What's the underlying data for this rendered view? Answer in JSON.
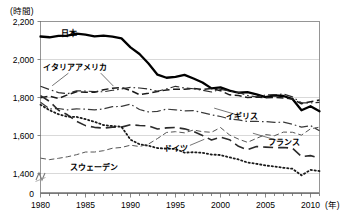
{
  "chart_data": {
    "type": "line",
    "title": "",
    "subtitle": "",
    "xlabel": "(年)",
    "ylabel": "(時間)",
    "y_unit_label": "(時間)",
    "x_unit_label": "(年)",
    "grid": true,
    "legend_position": "inline-annotations",
    "xlim": [
      1980,
      2011
    ],
    "ylim": [
      1300,
      2200
    ],
    "y_axis_break": true,
    "y_break_symbol": "zigzag",
    "yticks": [
      0,
      1400,
      1600,
      1800,
      2000,
      2200
    ],
    "ytick_labels": [
      "0",
      "1,400",
      "1,600",
      "1,800",
      "2,000",
      "2,200"
    ],
    "xticks": [
      1980,
      1985,
      1990,
      1995,
      2000,
      2005,
      2010
    ],
    "xtick_labels": [
      "1980",
      "1985",
      "1990",
      "1995",
      "2000",
      "2005",
      "2010"
    ],
    "x_minor_tick_interval": 1,
    "x": [
      1980,
      1981,
      1982,
      1983,
      1984,
      1985,
      1986,
      1987,
      1988,
      1989,
      1990,
      1991,
      1992,
      1993,
      1994,
      1995,
      1996,
      1997,
      1998,
      1999,
      2000,
      2001,
      2002,
      2003,
      2004,
      2005,
      2006,
      2007,
      2008,
      2009,
      2010,
      2011
    ],
    "series": [
      {
        "name": "日本",
        "label": "日本",
        "style": "solid-thick",
        "color": "#000000",
        "label_x": 1983.2,
        "label_y": 2140,
        "values": [
          2121,
          2117,
          2124,
          2126,
          2136,
          2131,
          2122,
          2126,
          2120,
          2111,
          2064,
          2029,
          1979,
          1920,
          1904,
          1909,
          1919,
          1900,
          1879,
          1848,
          1853,
          1836,
          1825,
          1828,
          1816,
          1802,
          1811,
          1808,
          1792,
          1733,
          1754,
          1728
        ]
      },
      {
        "name": "アメリカ",
        "label": "アメリカ",
        "style": "dashed",
        "color": "#1a1a1a",
        "label_x": 1985.6,
        "label_y": 1962,
        "values": [
          1799,
          1807,
          1795,
          1814,
          1830,
          1828,
          1828,
          1841,
          1849,
          1853,
          1837,
          1815,
          1822,
          1831,
          1840,
          1844,
          1843,
          1848,
          1843,
          1847,
          1836,
          1814,
          1810,
          1800,
          1802,
          1799,
          1800,
          1798,
          1792,
          1767,
          1778,
          1787
        ]
      },
      {
        "name": "イタリア",
        "label": "イタリア",
        "style": "dash-dot",
        "color": "#2b2b2b",
        "label_x": 1982.1,
        "label_y": 1963,
        "values": [
          1859,
          1842,
          1826,
          1820,
          1835,
          1834,
          1831,
          1830,
          1838,
          1845,
          1853,
          1850,
          1845,
          1833,
          1845,
          1859,
          1850,
          1846,
          1838,
          1829,
          1843,
          1834,
          1827,
          1811,
          1803,
          1813,
          1815,
          1818,
          1803,
          1772,
          1772,
          1774
        ]
      },
      {
        "name": "イギリス",
        "label": "イギリス",
        "style": "dash-dot",
        "color": "#3a3a3a",
        "label_x": 2002.4,
        "label_y": 1702,
        "values": [
          1775,
          1740,
          1742,
          1735,
          1740,
          1739,
          1735,
          1740,
          1752,
          1753,
          1765,
          1737,
          1724,
          1727,
          1739,
          1735,
          1730,
          1731,
          1720,
          1709,
          1700,
          1687,
          1682,
          1674,
          1674,
          1673,
          1669,
          1670,
          1659,
          1644,
          1652,
          1625
        ]
      },
      {
        "name": "フランス",
        "label": "フランス",
        "style": "long-dash",
        "color": "#2b2b2b",
        "label_x": 2007.0,
        "label_y": 1565,
        "values": [
          1810,
          1780,
          1733,
          1709,
          1675,
          1652,
          1643,
          1639,
          1644,
          1644,
          1657,
          1653,
          1651,
          1634,
          1640,
          1642,
          1635,
          1622,
          1600,
          1576,
          1591,
          1578,
          1543,
          1525,
          1542,
          1539,
          1536,
          1537,
          1533,
          1489,
          1494,
          1482
        ]
      },
      {
        "name": "ドイツ",
        "label": "ドイツ",
        "style": "dotted",
        "color": "#1a1a1a",
        "label_x": 1995.0,
        "label_y": 1535,
        "values": [
          1762,
          1733,
          1712,
          1699,
          1698,
          1686,
          1672,
          1655,
          1650,
          1646,
          1578,
          1554,
          1546,
          1534,
          1531,
          1529,
          1510,
          1512,
          1509,
          1500,
          1497,
          1485,
          1474,
          1458,
          1451,
          1442,
          1437,
          1430,
          1425,
          1390,
          1419,
          1413
        ]
      },
      {
        "name": "スウェーデン",
        "label": "スウェーデン",
        "style": "thin-dash",
        "color": "#555555",
        "label_x": 1985.9,
        "label_y": 1432,
        "values": [
          1481,
          1473,
          1480,
          1488,
          1499,
          1513,
          1513,
          1520,
          1533,
          1537,
          1549,
          1542,
          1555,
          1584,
          1616,
          1620,
          1614,
          1629,
          1620,
          1617,
          1642,
          1603,
          1581,
          1564,
          1585,
          1605,
          1599,
          1618,
          1617,
          1602,
          1635,
          1644
        ]
      }
    ],
    "annotations": [
      {
        "series": "イタリア",
        "leader_from": [
          1983.1,
          1928
        ],
        "leader_to": [
          1981.3,
          1862
        ]
      },
      {
        "series": "アメリカ",
        "leader_from": [
          1986.7,
          1928
        ],
        "leader_to": [
          1988.1,
          1860
        ]
      },
      {
        "series": "イギリス",
        "leader_from": [
          2001.6,
          1712
        ],
        "leader_to": [
          1999.3,
          1744
        ]
      },
      {
        "series": "フランス",
        "leader_from": [
          2006.2,
          1576
        ],
        "leader_to": [
          2003.6,
          1612
        ]
      },
      {
        "series": "ドイツ",
        "leader_from": [
          1996.6,
          1548
        ],
        "leader_to": [
          1998.2,
          1580
        ]
      }
    ]
  }
}
